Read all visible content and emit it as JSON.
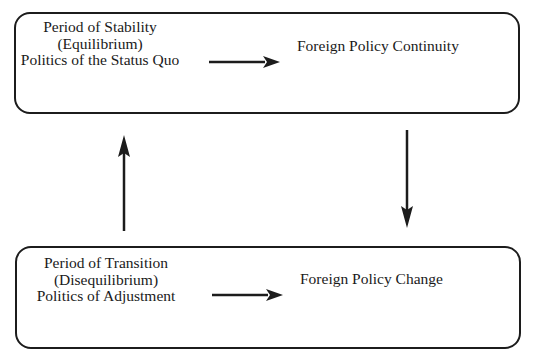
{
  "diagram": {
    "top_box": {
      "state_lines": [
        "Period of Stability",
        "(Equilibrium)",
        "Politics of the Status Quo"
      ],
      "outcome": "Foreign Policy Continuity"
    },
    "bottom_box": {
      "state_lines": [
        "Period of Transition",
        "(Disequilibrium)",
        "Politics of Adjustment"
      ],
      "outcome": "Foreign Policy Change"
    },
    "arrows": [
      {
        "from": "top_box.state",
        "to": "top_box.outcome",
        "direction": "right"
      },
      {
        "from": "bottom_box.state",
        "to": "bottom_box.outcome",
        "direction": "right"
      },
      {
        "from": "top_box",
        "to": "bottom_box",
        "direction": "down"
      },
      {
        "from": "bottom_box",
        "to": "top_box",
        "direction": "up"
      }
    ],
    "colors": {
      "line": "#1c1c1c",
      "text": "#1a1a1a",
      "background": "#ffffff"
    }
  }
}
